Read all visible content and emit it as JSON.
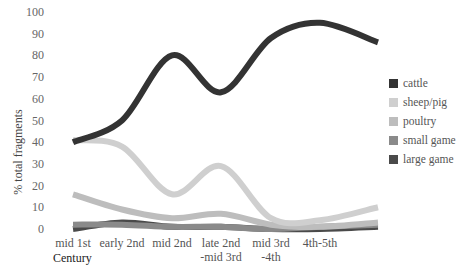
{
  "chart_data": {
    "type": "line",
    "title": "",
    "xlabel": "Century",
    "ylabel": "% total fragments",
    "ylim": [
      0,
      100
    ],
    "yticks": [
      0,
      10,
      20,
      30,
      40,
      50,
      60,
      70,
      80,
      90,
      100
    ],
    "grid": false,
    "legend_position": "right",
    "categories": [
      "mid 1st",
      "early 2nd",
      "mid 2nd",
      "late 2nd -mid 3rd",
      "mid 3rd -4th",
      "4th-5th"
    ],
    "category_labels": [
      [
        "mid 1st"
      ],
      [
        "early 2nd"
      ],
      [
        "mid 2nd"
      ],
      [
        "late 2nd",
        "-mid 3rd"
      ],
      [
        "mid 3rd",
        "-4th"
      ],
      [
        "4th-5th"
      ]
    ],
    "series": [
      {
        "name": "cattle",
        "color": "#333333",
        "values": [
          40,
          50,
          80,
          63,
          88,
          95
        ],
        "tail": 86
      },
      {
        "name": "sheep/pig",
        "color": "#cfcfcf",
        "values": [
          41,
          38,
          16,
          29,
          5,
          4
        ],
        "tail": 10
      },
      {
        "name": "poultry",
        "color": "#bdbdbd",
        "values": [
          16,
          9,
          5,
          7,
          2,
          1
        ],
        "tail": 3
      },
      {
        "name": "small game",
        "color": "#8a8a8a",
        "values": [
          2,
          2,
          1,
          1,
          0,
          1
        ],
        "tail": 2
      },
      {
        "name": "large game",
        "color": "#4a4a4a",
        "values": [
          0,
          3,
          1,
          1,
          0,
          0
        ],
        "tail": 1
      }
    ]
  }
}
